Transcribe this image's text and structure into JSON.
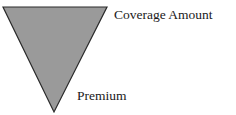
{
  "diagram": {
    "shape": "inverted-triangle",
    "fill_color": "#9a9a9a",
    "stroke_color": "#2a2a2a",
    "labels": {
      "top": "Coverage Amount",
      "bottom": "Premium"
    }
  }
}
